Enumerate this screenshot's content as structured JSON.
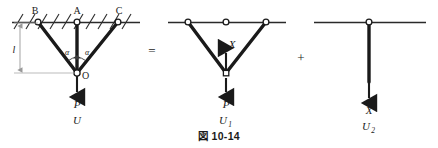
{
  "figure": {
    "caption": "図 10-14",
    "operators": {
      "equals": "=",
      "plus": "+"
    },
    "diagrams": [
      {
        "id": "full-structure",
        "nodes": [
          {
            "name": "B",
            "label": "B",
            "x": 38,
            "y": 22
          },
          {
            "name": "A",
            "label": "A",
            "x": 77,
            "y": 22
          },
          {
            "name": "C",
            "label": "C",
            "x": 118,
            "y": 22
          },
          {
            "name": "O",
            "label": "O",
            "x": 77,
            "y": 73
          }
        ],
        "angles": [
          {
            "label": "α",
            "x": 67,
            "y": 53
          },
          {
            "label": "α",
            "x": 86,
            "y": 53
          }
        ],
        "dimension": {
          "label": "l",
          "x": 22,
          "y": 50
        },
        "force": {
          "label": "P",
          "x": 77,
          "y": 104
        },
        "energy": {
          "label": "U",
          "base": "U",
          "sub": "",
          "x": 77,
          "y": 120
        },
        "support": "hatched-ceiling"
      },
      {
        "id": "substructure-one",
        "nodes": [
          {
            "name": "B1",
            "label": "",
            "x": 188,
            "y": 22
          },
          {
            "name": "A1",
            "label": "",
            "x": 226,
            "y": 22
          },
          {
            "name": "C1",
            "label": "",
            "x": 266,
            "y": 22
          },
          {
            "name": "O1",
            "label": "",
            "x": 226,
            "y": 73
          }
        ],
        "redundant_force": {
          "label": "X",
          "x": 231,
          "y": 46
        },
        "force": {
          "label": "P",
          "x": 226,
          "y": 104
        },
        "energy": {
          "label": "U₁",
          "base": "U",
          "sub": "1",
          "x": 226,
          "y": 120
        },
        "support": "plain-line"
      },
      {
        "id": "substructure-two",
        "nodes": [
          {
            "name": "A2",
            "label": "",
            "x": 369,
            "y": 22
          }
        ],
        "redundant_force": {
          "label": "X",
          "x": 369,
          "y": 110
        },
        "energy": {
          "label": "U₂",
          "base": "U",
          "sub": "2",
          "x": 369,
          "y": 126
        },
        "support": "plain-line"
      }
    ]
  },
  "colors": {
    "bar": "#1a1a1a",
    "line": "#3a3a3a",
    "dimension": "#999999",
    "text": "#1a1a1a",
    "background": "#ffffff"
  }
}
